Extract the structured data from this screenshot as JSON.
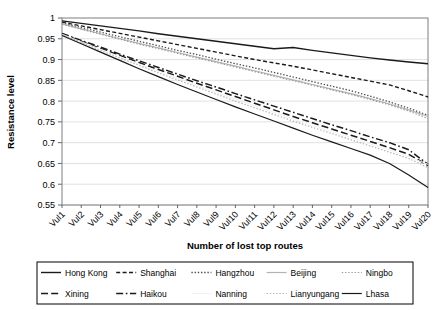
{
  "chart_data": {
    "type": "line",
    "title": "",
    "xlabel": "Number of lost top routes",
    "ylabel": "Resistance level",
    "ylim": [
      0.55,
      1.0
    ],
    "ytick_step": 0.05,
    "yticks": [
      "1",
      "0.95",
      "0.9",
      "0.85",
      "0.8",
      "0.75",
      "0.7",
      "0.65",
      "0.6",
      "0.55"
    ],
    "grid": true,
    "grid_axis": "y",
    "legend_position": "bottom",
    "legend_columns": 5,
    "legend_rows": 2,
    "legend_border": true,
    "categories": [
      "Vul1",
      "Vul2",
      "Vul3",
      "Vul4",
      "Vul5",
      "Vul6",
      "Vul7",
      "Vul8",
      "Vul9",
      "Vul10",
      "Vul11",
      "Vul12",
      "Vul13",
      "Vul14",
      "Vul15",
      "Vul16",
      "Vul17",
      "Vul18",
      "Vul19",
      "Vul20"
    ],
    "xtick_rotation": -45,
    "series": [
      {
        "name": "Hong Kong",
        "style": "solid",
        "color": "#1a1a1a",
        "width": 1.4,
        "values": [
          0.993,
          0.987,
          0.981,
          0.975,
          0.969,
          0.962,
          0.956,
          0.95,
          0.944,
          0.938,
          0.932,
          0.926,
          0.929,
          0.922,
          0.916,
          0.91,
          0.904,
          0.899,
          0.894,
          0.89
        ]
      },
      {
        "name": "Shanghai",
        "style": "dashed",
        "color": "#1a1a1a",
        "width": 1.4,
        "values": [
          0.99,
          0.981,
          0.972,
          0.963,
          0.954,
          0.945,
          0.936,
          0.927,
          0.918,
          0.909,
          0.9,
          0.892,
          0.884,
          0.875,
          0.866,
          0.857,
          0.848,
          0.839,
          0.825,
          0.81
        ]
      },
      {
        "name": "Hangzhou",
        "style": "dotted",
        "color": "#4d4d4d",
        "width": 1.3,
        "values": [
          0.988,
          0.977,
          0.966,
          0.955,
          0.944,
          0.933,
          0.922,
          0.912,
          0.901,
          0.89,
          0.88,
          0.869,
          0.858,
          0.847,
          0.836,
          0.825,
          0.812,
          0.798,
          0.783,
          0.766
        ]
      },
      {
        "name": "Beijing",
        "style": "solid",
        "color": "#b3b3b3",
        "width": 1.2,
        "values": [
          0.986,
          0.974,
          0.962,
          0.95,
          0.939,
          0.928,
          0.917,
          0.906,
          0.895,
          0.884,
          0.873,
          0.862,
          0.851,
          0.84,
          0.829,
          0.818,
          0.806,
          0.793,
          0.779,
          0.763
        ]
      },
      {
        "name": "Ningbo",
        "style": "dotted",
        "color": "#999999",
        "width": 1.2,
        "values": [
          0.985,
          0.973,
          0.961,
          0.949,
          0.937,
          0.926,
          0.915,
          0.904,
          0.893,
          0.882,
          0.871,
          0.86,
          0.849,
          0.838,
          0.827,
          0.816,
          0.804,
          0.791,
          0.776,
          0.758
        ]
      },
      {
        "name": "Xining",
        "style": "longdash",
        "color": "#1a1a1a",
        "width": 1.5,
        "values": [
          0.962,
          0.944,
          0.927,
          0.91,
          0.893,
          0.876,
          0.86,
          0.843,
          0.827,
          0.811,
          0.795,
          0.779,
          0.763,
          0.748,
          0.733,
          0.718,
          0.703,
          0.688,
          0.672,
          0.645
        ]
      },
      {
        "name": "Haikou",
        "style": "dashdot",
        "color": "#1a1a1a",
        "width": 1.5,
        "values": [
          0.963,
          0.946,
          0.93,
          0.913,
          0.897,
          0.881,
          0.865,
          0.849,
          0.834,
          0.818,
          0.803,
          0.788,
          0.773,
          0.758,
          0.743,
          0.729,
          0.714,
          0.7,
          0.683,
          0.648
        ]
      },
      {
        "name": "Nanning",
        "style": "solid",
        "color": "#f2f2f2",
        "width": 1.0,
        "values": [
          0.961,
          0.943,
          0.925,
          0.907,
          0.889,
          0.872,
          0.855,
          0.838,
          0.821,
          0.805,
          0.789,
          0.773,
          0.757,
          0.742,
          0.727,
          0.712,
          0.697,
          0.682,
          0.666,
          0.648
        ]
      },
      {
        "name": "Lianyungang",
        "style": "dotted",
        "color": "#b3b3b3",
        "width": 1.2,
        "values": [
          0.96,
          0.941,
          0.922,
          0.904,
          0.886,
          0.868,
          0.851,
          0.834,
          0.817,
          0.8,
          0.784,
          0.768,
          0.752,
          0.737,
          0.722,
          0.707,
          0.692,
          0.677,
          0.662,
          0.64
        ]
      },
      {
        "name": "Lhasa",
        "style": "solid",
        "color": "#1a1a1a",
        "width": 1.2,
        "values": [
          0.958,
          0.938,
          0.918,
          0.898,
          0.878,
          0.859,
          0.84,
          0.822,
          0.804,
          0.786,
          0.769,
          0.752,
          0.735,
          0.718,
          0.702,
          0.686,
          0.67,
          0.65,
          0.622,
          0.592
        ]
      }
    ]
  }
}
